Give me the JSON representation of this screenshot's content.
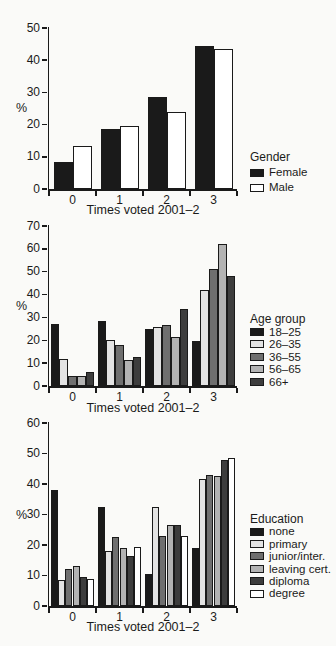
{
  "figure": {
    "background": "#fafaf8",
    "ink_color": "#1a1a1a"
  },
  "chart_data": [
    {
      "type": "bar",
      "title": "",
      "xlabel": "Times voted 2001–2",
      "ylabel": "%",
      "ylim": [
        0,
        50
      ],
      "yticks": [
        0,
        10,
        20,
        30,
        40,
        50
      ],
      "categories": [
        "0",
        "1",
        "2",
        "3"
      ],
      "grid": false,
      "legend_title": "Gender",
      "legend_position": "right",
      "series": [
        {
          "name": "Female",
          "color": "#1a1a1a",
          "values": [
            8.5,
            18.5,
            28.5,
            44.5
          ]
        },
        {
          "name": "Male",
          "color": "#ffffff",
          "values": [
            13.5,
            19.5,
            24,
            43.5
          ]
        }
      ]
    },
    {
      "type": "bar",
      "title": "",
      "xlabel": "Times voted 2001–2",
      "ylabel": "%",
      "ylim": [
        0,
        70
      ],
      "yticks": [
        0,
        10,
        20,
        30,
        40,
        50,
        60,
        70
      ],
      "categories": [
        "0",
        "1",
        "2",
        "3"
      ],
      "grid": false,
      "legend_title": "Age group",
      "legend_position": "right",
      "series": [
        {
          "name": "18–25",
          "color": "#1a1a1a",
          "values": [
            27,
            28.5,
            25,
            19.5
          ]
        },
        {
          "name": "26–35",
          "color": "#e3e3e3",
          "values": [
            12,
            20,
            26,
            42
          ]
        },
        {
          "name": "36–55",
          "color": "#6f6f6f",
          "values": [
            4.5,
            18,
            26.5,
            51
          ]
        },
        {
          "name": "56–65",
          "color": "#b3b3b3",
          "values": [
            4.5,
            11.5,
            21.5,
            62
          ]
        },
        {
          "name": "66+",
          "color": "#3d3d3d",
          "values": [
            6,
            12.5,
            33.5,
            48
          ]
        }
      ]
    },
    {
      "type": "bar",
      "title": "",
      "xlabel": "Times voted 2001–2",
      "ylabel": "%",
      "ylim": [
        0,
        60
      ],
      "yticks": [
        0,
        10,
        20,
        30,
        40,
        50,
        60
      ],
      "categories": [
        "0",
        "1",
        "2",
        "3"
      ],
      "grid": false,
      "legend_title": "Education",
      "legend_position": "right",
      "series": [
        {
          "name": "none",
          "color": "#1a1a1a",
          "values": [
            38,
            32.5,
            10.5,
            19
          ]
        },
        {
          "name": "primary",
          "color": "#e3e3e3",
          "values": [
            8.5,
            18,
            32.5,
            41.5
          ]
        },
        {
          "name": "junior/inter.",
          "color": "#6f6f6f",
          "values": [
            12,
            22.5,
            23,
            43
          ]
        },
        {
          "name": "leaving cert.",
          "color": "#b3b3b3",
          "values": [
            13,
            19,
            26.5,
            42.5
          ]
        },
        {
          "name": "diploma",
          "color": "#3d3d3d",
          "values": [
            9.5,
            16.5,
            26.5,
            48
          ]
        },
        {
          "name": "degree",
          "color": "#ffffff",
          "values": [
            9,
            19.5,
            23,
            48.5
          ]
        }
      ]
    }
  ]
}
